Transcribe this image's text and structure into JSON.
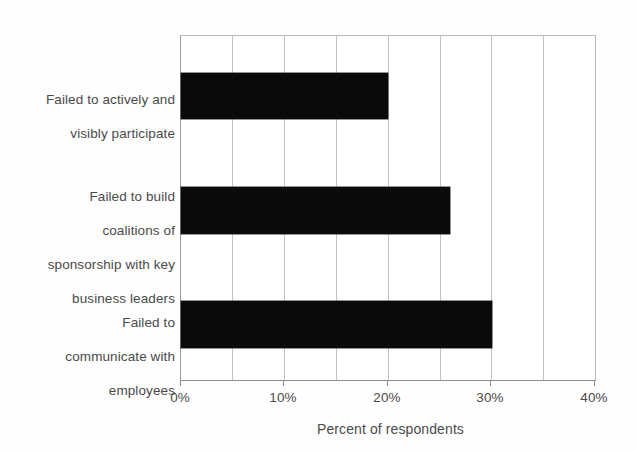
{
  "chart_data": {
    "type": "bar",
    "orientation": "horizontal",
    "title": "",
    "xlabel": "Percent of respondents",
    "ylabel": "",
    "xlim": [
      0,
      40
    ],
    "xtick_labels": [
      "0%",
      "10%",
      "20%",
      "30%",
      "40%"
    ],
    "xtick_values": [
      0,
      10,
      20,
      30,
      40
    ],
    "minor_gridline_step": 5,
    "grid": true,
    "legend": "none",
    "bar_color": "#000000",
    "categories": [
      "Failed to actively and\nvisibly participate",
      "Failed to build\ncoalitions of\nsponsorship with key\nbusiness leaders",
      "Failed to\ncommunicate with\nemployees"
    ],
    "values": [
      20,
      26,
      30
    ]
  },
  "axes": {
    "x_title": "Percent of respondents",
    "ticks": [
      {
        "label": "0%",
        "value": 0
      },
      {
        "label": "10%",
        "value": 10
      },
      {
        "label": "20%",
        "value": 20
      },
      {
        "label": "30%",
        "value": 30
      },
      {
        "label": "40%",
        "value": 40
      }
    ]
  },
  "bars": [
    {
      "label_line1": "Failed to actively and",
      "label_line2": "visibly participate",
      "value": 20
    },
    {
      "label_line1": "Failed to build",
      "label_line2": "coalitions of",
      "label_line3": "sponsorship with key",
      "label_line4": "business leaders",
      "value": 26
    },
    {
      "label_line1": "Failed to",
      "label_line2": "communicate with",
      "label_line3": "employees",
      "value": 30
    }
  ]
}
